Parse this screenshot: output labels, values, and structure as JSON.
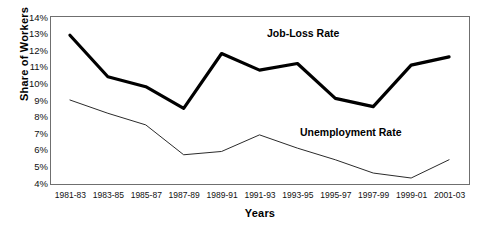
{
  "chart_data": {
    "type": "line",
    "title": "",
    "xlabel": "Years",
    "ylabel": "Share of Workers",
    "categories": [
      "1981-83",
      "1983-85",
      "1985-87",
      "1987-89",
      "1989-91",
      "1991-93",
      "1993-95",
      "1995-97",
      "1997-99",
      "1999-01",
      "2001-03"
    ],
    "ylim": [
      4,
      14
    ],
    "ytick_labels": [
      "14%",
      "13%",
      "12%",
      "11%",
      "10%",
      "9%",
      "8%",
      "7%",
      "6%",
      "5%",
      "4%"
    ],
    "ytick_values": [
      14,
      13,
      12,
      11,
      10,
      9,
      8,
      7,
      6,
      5,
      4
    ],
    "grid": false,
    "legend_position": "inline-annotations",
    "series": [
      {
        "name": "Job-Loss Rate",
        "values": [
          12.9,
          10.4,
          9.8,
          8.5,
          11.8,
          10.8,
          11.2,
          9.1,
          8.6,
          11.1,
          11.6
        ],
        "color": "#000000",
        "line_width": 3.2,
        "annotation": "Job-Loss Rate"
      },
      {
        "name": "Unemployment Rate",
        "values": [
          9.0,
          8.2,
          7.5,
          5.7,
          5.9,
          6.9,
          6.1,
          5.4,
          4.6,
          4.3,
          5.4
        ],
        "color": "#2b2b2b",
        "line_width": 1.0,
        "annotation": "Unemployment Rate"
      }
    ]
  }
}
